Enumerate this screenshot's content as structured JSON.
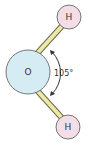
{
  "diagram": {
    "atoms": [
      {
        "id": "oxygen",
        "label": "O",
        "fill": "#d6ecf5",
        "stroke": "#555555"
      },
      {
        "id": "hydrogen-top",
        "label": "H",
        "fill": "#f3dde6",
        "stroke": "#555555"
      },
      {
        "id": "hydrogen-bottom",
        "label": "H",
        "fill": "#f3dde6",
        "stroke": "#555555"
      }
    ],
    "bonds": [
      {
        "from": "oxygen",
        "to": "hydrogen-top",
        "color": "#ece9a8"
      },
      {
        "from": "oxygen",
        "to": "hydrogen-bottom",
        "color": "#ece9a8"
      }
    ],
    "angle": {
      "label": "105°",
      "icon": "double-arrow-arc-icon"
    }
  }
}
